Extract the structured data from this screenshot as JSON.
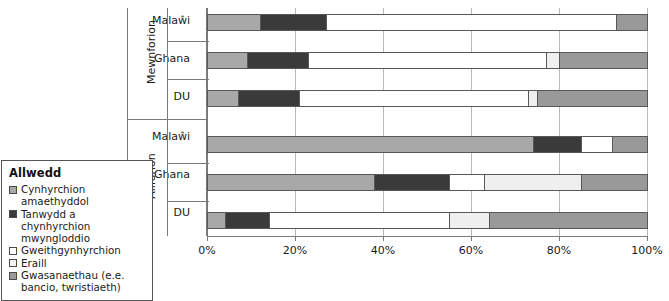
{
  "legend": {
    "title": "Allwedd",
    "items": [
      {
        "label": "Cynhyrchion amaethyddol",
        "color": "#a8a8a8",
        "key": "agricultural"
      },
      {
        "label": "Tanwydd a chynhyrchion mwyngloddio",
        "color": "#3a3a3a",
        "key": "fuels-mining"
      },
      {
        "label": "Gweithgynhyrchion",
        "color": "#ffffff",
        "key": "manufactures"
      },
      {
        "label": "Eraill",
        "color": "#e8e8e8",
        "key": "other"
      },
      {
        "label": "Gwasanaethau (e.e. bancio, twristiaeth)",
        "color": "#999999",
        "key": "services"
      }
    ]
  },
  "chart_data": {
    "type": "bar",
    "orientation": "horizontal",
    "stacked": true,
    "normalized": true,
    "title": "",
    "xlabel": "",
    "ylabel": "",
    "xlim": [
      0,
      100
    ],
    "xticks": [
      0,
      20,
      40,
      60,
      80,
      100
    ],
    "xtick_labels": [
      "0%",
      "20%",
      "40%",
      "60%",
      "80%",
      "100%"
    ],
    "grid": true,
    "legend_position": "left",
    "groups": [
      {
        "name": "Mewnforion",
        "categories": [
          "Malaŵi",
          "Ghana",
          "DU"
        ],
        "rows": [
          {
            "category": "Malaŵi",
            "values": [
              12,
              15,
              66,
              0,
              7
            ]
          },
          {
            "category": "Ghana",
            "values": [
              9,
              14,
              54,
              3,
              20
            ]
          },
          {
            "category": "DU",
            "values": [
              7,
              14,
              52,
              2,
              25
            ]
          }
        ]
      },
      {
        "name": "Allforion",
        "categories": [
          "Malaŵi",
          "Ghana",
          "DU"
        ],
        "rows": [
          {
            "category": "Malaŵi",
            "values": [
              74,
              11,
              7,
              0,
              8
            ]
          },
          {
            "category": "Ghana",
            "values": [
              38,
              17,
              8,
              22,
              15
            ]
          },
          {
            "category": "DU",
            "values": [
              4,
              10,
              41,
              9,
              36
            ]
          }
        ]
      }
    ],
    "series": [
      {
        "name": "Cynhyrchion amaethyddol",
        "color": "#a8a8a8"
      },
      {
        "name": "Tanwydd a chynhyrchion mwyngloddio",
        "color": "#3a3a3a"
      },
      {
        "name": "Gweithgynhyrchion",
        "color": "#ffffff"
      },
      {
        "name": "Eraill",
        "color": "#e8e8e8"
      },
      {
        "name": "Gwasanaethau (e.e. bancio, twristiaeth)",
        "color": "#999999"
      }
    ]
  }
}
